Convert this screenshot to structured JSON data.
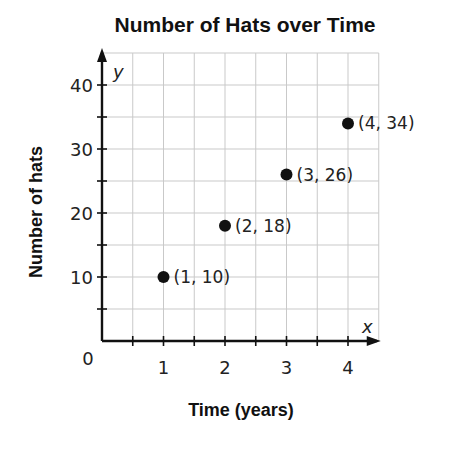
{
  "chart_data": {
    "type": "scatter",
    "title": "Number of Hats over Time",
    "xlabel": "Time (years)",
    "ylabel": "Number of hats",
    "x_axis_variable": "x",
    "y_axis_variable": "y",
    "origin_label": "0",
    "xlim": [
      0,
      4.5
    ],
    "ylim": [
      0,
      45
    ],
    "x_ticks": [
      1,
      2,
      3,
      4
    ],
    "x_minor_step": 0.5,
    "y_ticks": [
      10,
      20,
      30,
      40
    ],
    "y_minor_step": 5,
    "grid": true,
    "legend": null,
    "series": [
      {
        "name": "Hats",
        "points": [
          {
            "x": 1,
            "y": 10,
            "label": "(1, 10)"
          },
          {
            "x": 2,
            "y": 18,
            "label": "(2, 18)"
          },
          {
            "x": 3,
            "y": 26,
            "label": "(3, 26)"
          },
          {
            "x": 4,
            "y": 34,
            "label": "(4, 34)"
          }
        ],
        "color": "#111111"
      }
    ]
  }
}
